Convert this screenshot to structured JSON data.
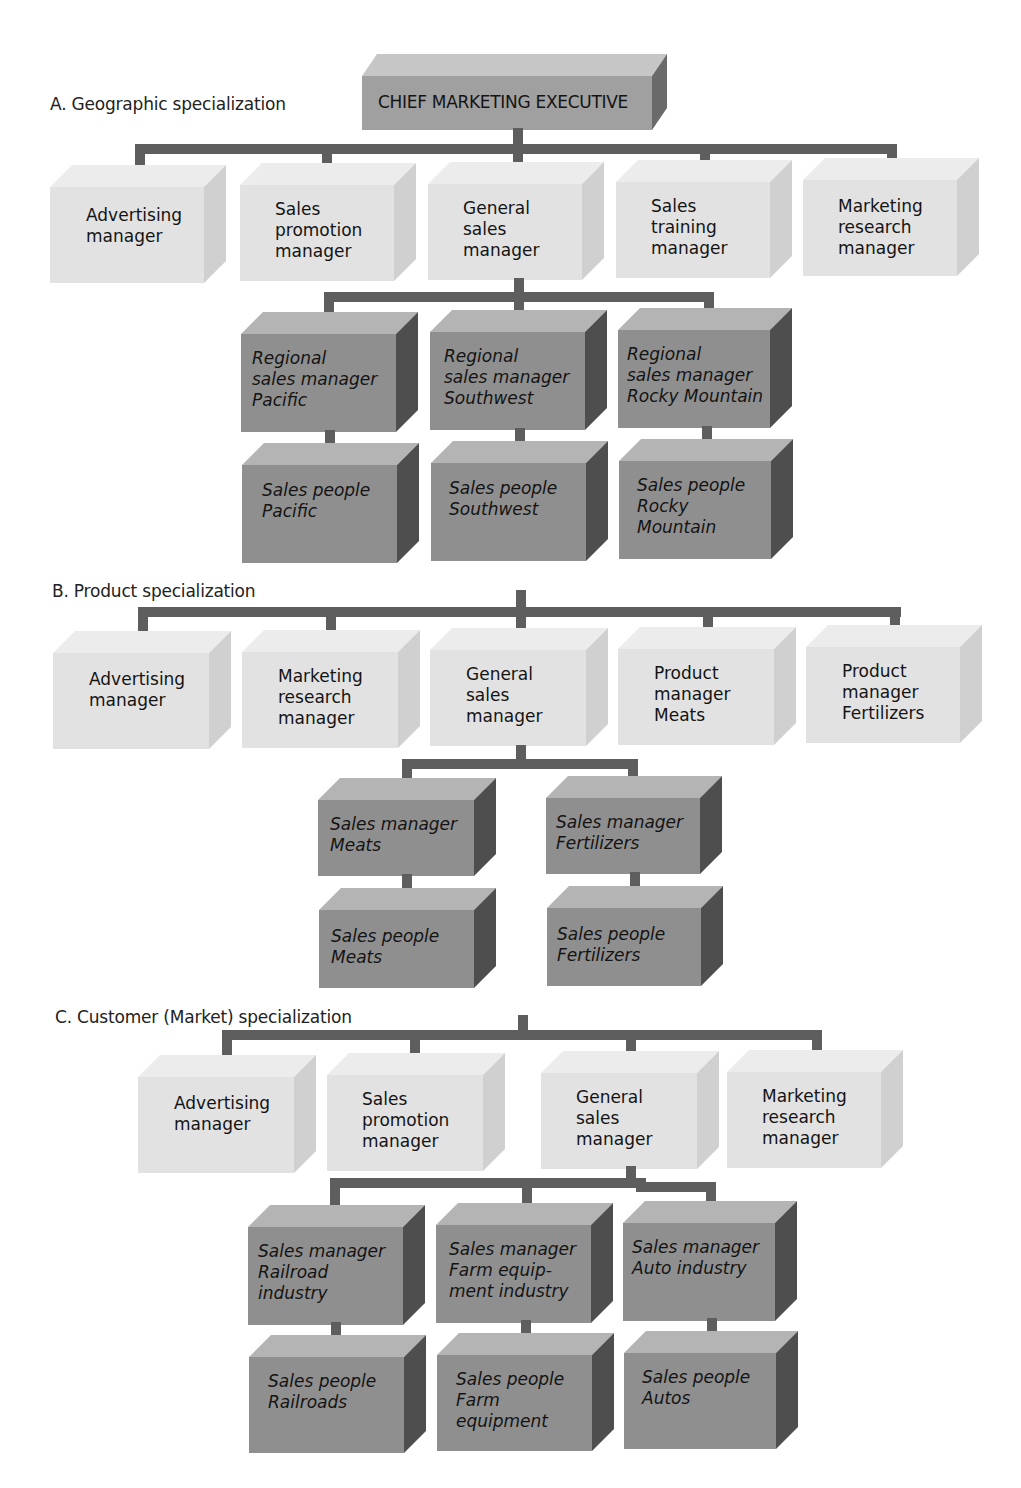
{
  "chief": {
    "label": "CHIEF MARKETING EXECUTIVE"
  },
  "sections": [
    {
      "label": "A. Geographic specialization",
      "level1": [
        "Advertising\nmanager",
        "Sales\npromotion\nmanager",
        "General\nsales\nmanager",
        "Sales\ntraining\nmanager",
        "Marketing\nresearch\nmanager"
      ],
      "level2": [
        "Regional\nsales manager\nPacific",
        "Regional\nsales manager\nSouthwest",
        "Regional\nsales manager\nRocky Mountain"
      ],
      "level3": [
        "Sales people\nPacific",
        "Sales people\nSouthwest",
        "Sales people\nRocky\nMountain"
      ]
    },
    {
      "label": "B. Product specialization",
      "level1": [
        "Advertising\nmanager",
        "Marketing\nresearch\nmanager",
        "General\nsales\nmanager",
        "Product\nmanager\nMeats",
        "Product\nmanager\nFertilizers"
      ],
      "level2": [
        "Sales manager\nMeats",
        "Sales manager\nFertilizers"
      ],
      "level3": [
        "Sales people\nMeats",
        "Sales people\nFertilizers"
      ]
    },
    {
      "label": "C. Customer (Market) specialization",
      "level1": [
        "Advertising\nmanager",
        "Sales\npromotion\nmanager",
        "General\nsales\nmanager",
        "Marketing\nresearch\nmanager"
      ],
      "level2": [
        "Sales manager\nRailroad\nindustry",
        "Sales manager\nFarm equip-\nment industry",
        "Sales manager\nAuto industry"
      ],
      "level3": [
        "Sales people\nRailroads",
        "Sales people\nFarm\nequipment",
        "Sales people\nAutos"
      ]
    }
  ],
  "colors": {
    "connector": "#5e5e5e",
    "staff_box": "#e2e2e2",
    "line_box": "#8f8f8f",
    "line_box_side": "#4e4e4e",
    "exec_box": "#a0a0a0"
  }
}
